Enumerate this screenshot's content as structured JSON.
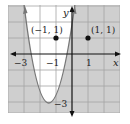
{
  "figure": {
    "axes": {
      "x_label": "x",
      "y_label": "y",
      "x_tick_labels": [
        "−3",
        "−1",
        "1"
      ],
      "y_tick_labels": [
        "−3"
      ]
    },
    "points": [
      {
        "label": "(−1, 1)",
        "x": -1,
        "y": 1
      },
      {
        "label": "(1, 1)",
        "x": 1,
        "y": 1
      }
    ],
    "curve": {
      "type": "parabola",
      "equation": "y = (4/3)x^2 + 4x",
      "vertex": [
        -1.5,
        -3
      ],
      "x_intercepts": [
        -3,
        0
      ],
      "style": "solid",
      "shading": "outside"
    },
    "colors": {
      "shade": "#cfcfcf",
      "grid": "#a3a3a3",
      "axis": "#111111",
      "curve": "#777777",
      "inside": "#ffffff"
    }
  }
}
